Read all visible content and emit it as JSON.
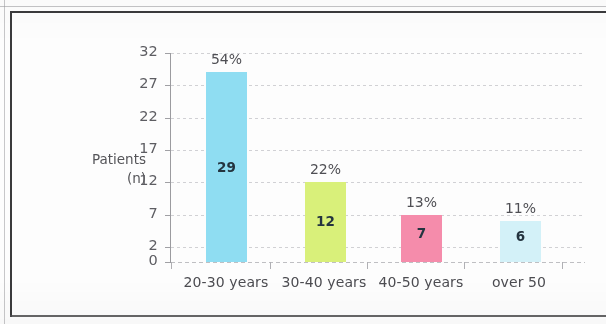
{
  "chart_data": {
    "type": "bar",
    "title": "",
    "xlabel": "",
    "ylabel": "Patients\n(n)",
    "ylabel_line1": "Patients",
    "ylabel_line2": "(n)",
    "categories": [
      "20-30 years",
      "30-40 years",
      "40-50 years",
      "over 50"
    ],
    "values": [
      29,
      12,
      7,
      6
    ],
    "value_labels": [
      "29",
      "12",
      "7",
      "6"
    ],
    "percent_labels": [
      "54%",
      "22%",
      "13%",
      "11%"
    ],
    "percents": [
      54,
      22,
      13,
      11
    ],
    "colors": [
      "#8fddf2",
      "#d9f07a",
      "#f58cab",
      "#d3f1f8"
    ],
    "ylim": [
      0,
      32
    ],
    "ytick_labels": [
      "32",
      "27",
      "22",
      "17",
      "12",
      "7",
      "2",
      "0"
    ],
    "yticks": [
      32,
      27,
      22,
      17,
      12,
      7,
      2,
      0
    ],
    "grid": true,
    "legend": "none",
    "value_label_color": "#24343f",
    "percent_label_color": "#4f4f54",
    "axis_color": "#9b9b9f",
    "grid_color": "#c9c9cd",
    "background": "#fdfdfd",
    "frame_color": "#3a3a3c"
  },
  "figure": {
    "caption": ""
  }
}
